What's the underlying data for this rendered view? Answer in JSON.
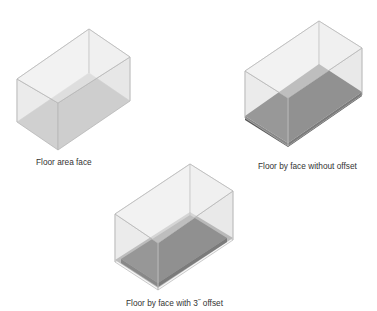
{
  "figure": {
    "colors": {
      "background": "#ffffff",
      "box_edge": "#b4b4b4",
      "glass_face": "#e8e8e8",
      "floor_area_face": "#bdbdbd",
      "floor_top": "#6f6f6f",
      "floor_side": "#5a5a5a",
      "offset_band": "#a6a6a6",
      "caption_text": "#333333"
    },
    "panels": [
      {
        "id": "floor-area-face",
        "caption": "Floor area face"
      },
      {
        "id": "floor-by-face-without-offset",
        "caption": "Floor by face without offset"
      },
      {
        "id": "floor-by-face-with-offset",
        "caption": "Floor by face with 3˝ offset"
      }
    ]
  }
}
